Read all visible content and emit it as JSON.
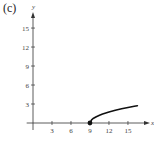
{
  "panel_label": "(c)",
  "chart_data": {
    "type": "line",
    "title": "",
    "xlabel": "x",
    "ylabel": "y",
    "xlim": [
      -1,
      17.5
    ],
    "ylim": [
      -1.5,
      18
    ],
    "xticks": [
      3,
      6,
      9,
      12,
      15
    ],
    "yticks": [
      3,
      6,
      9,
      12,
      15
    ],
    "grid": false,
    "legend": null,
    "series": [
      {
        "name": "y = sqrt(x - 9)",
        "x": [
          9,
          9.25,
          9.5,
          10,
          10.5,
          11,
          12,
          13,
          14,
          15,
          16,
          16.5
        ],
        "y": [
          0,
          0.5,
          0.71,
          1.0,
          1.22,
          1.41,
          1.73,
          2.0,
          2.24,
          2.45,
          2.65,
          2.74
        ],
        "start_point": {
          "x": 9,
          "y": 0,
          "marker": "filled-circle"
        }
      }
    ]
  }
}
